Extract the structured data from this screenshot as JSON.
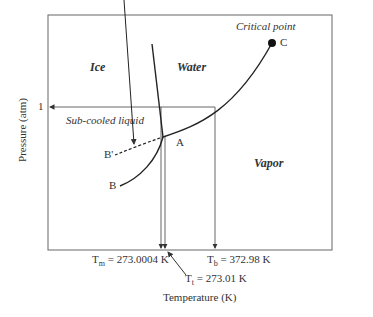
{
  "diagram": {
    "type": "phase-diagram",
    "title": "",
    "axes": {
      "x_label": "Temperature (K)",
      "y_label": "Pressure (atm)",
      "y_tick": "1"
    },
    "regions": {
      "ice": "Ice",
      "water": "Water",
      "vapor": "Vapor"
    },
    "points": {
      "critical_label": "Critical point",
      "C": "C",
      "A": "A",
      "B": "B",
      "B_prime": "B'"
    },
    "annotations": {
      "subcooled": "Sub-cooled liquid",
      "Tm_sym": "T",
      "Tm_sub": "m",
      "Tm_val": " = 273.0004 K",
      "Tt_sym": "T",
      "Tt_sub": "t",
      "Tt_val": " = 273.01 K",
      "Tb_sym": "T",
      "Tb_sub": "b",
      "Tb_val": " = 372.98 K"
    },
    "colors": {
      "line": "#333333",
      "frame": "#555555"
    }
  }
}
